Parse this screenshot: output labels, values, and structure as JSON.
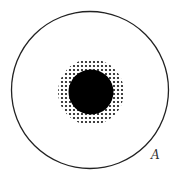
{
  "diagram": {
    "width": 180,
    "height": 180,
    "background": "#ffffff",
    "outer_circle": {
      "cx": 90,
      "cy": 90,
      "r": 78.5,
      "stroke": "#222222",
      "stroke_width": 1.3
    },
    "halo": {
      "cx": 91,
      "cy": 92,
      "r": 33,
      "dot_pitch": 4,
      "dot_radius": 1.1,
      "dot_color": "#111111"
    },
    "core_disk": {
      "cx": 91,
      "cy": 92,
      "r": 22.5,
      "fill": "#000000"
    },
    "label": {
      "text": "A",
      "x": 151,
      "y": 159
    }
  }
}
